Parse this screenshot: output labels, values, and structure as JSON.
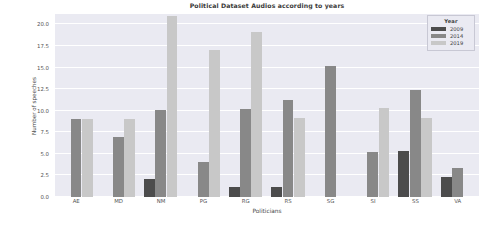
{
  "chart_data": {
    "type": "bar",
    "title": "Political Dataset Audios according to years",
    "xlabel": "Politicians",
    "ylabel": "Number of speeches",
    "categories": [
      "AE",
      "MD",
      "NM",
      "PG",
      "RG",
      "RS",
      "SG",
      "SI",
      "SS",
      "VA"
    ],
    "series": [
      {
        "name": "2009",
        "color": "#4c4c4c",
        "values": [
          0,
          0,
          2.1,
          0,
          1.2,
          1.2,
          0,
          0,
          5.3,
          2.3
        ]
      },
      {
        "name": "2014",
        "color": "#888888",
        "values": [
          9.0,
          7.0,
          10.1,
          4.1,
          10.2,
          11.2,
          15.2,
          5.2,
          12.4,
          3.4
        ]
      },
      {
        "name": "2019",
        "color": "#c8c8c8",
        "values": [
          9.0,
          9.0,
          21.0,
          17.0,
          19.1,
          9.1,
          0,
          10.3,
          9.2,
          0
        ]
      }
    ],
    "legend_title": "Year",
    "legend_position": "upper right",
    "ylim": [
      0,
      21.2
    ],
    "yticks": [
      0.0,
      2.5,
      5.0,
      7.5,
      10.0,
      12.5,
      15.0,
      17.5,
      20.0
    ],
    "ytick_labels": [
      "0.0",
      "2.5",
      "5.0",
      "7.5",
      "10.0",
      "12.5",
      "15.0",
      "17.5",
      "20.0"
    ],
    "grid": true,
    "grid_color": "#ffffff",
    "plot_background": "#eaeaf2",
    "figure_background": "#ffffff"
  }
}
